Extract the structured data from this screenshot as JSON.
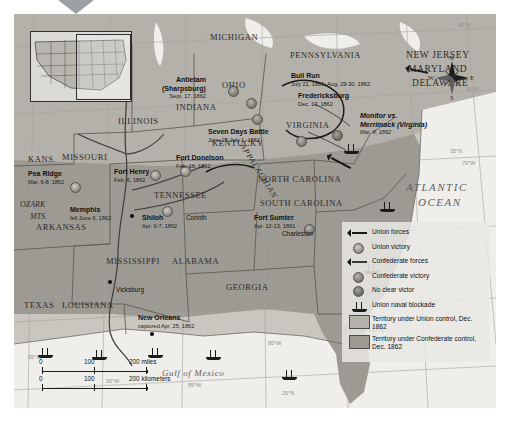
{
  "map": {
    "title": "Civil War in the East and West, 1861-1862",
    "ocean_label_line1": "ATLANTIC",
    "ocean_label_line2": "OCEAN",
    "gulf_label": "Gulf of Mexico",
    "ranges": [
      {
        "name": "APPALACHIAN"
      },
      {
        "name": "OZARK"
      },
      {
        "name": "MTS."
      }
    ],
    "states": [
      {
        "label": "MICHIGAN"
      },
      {
        "label": "PENNSYLVANIA"
      },
      {
        "label": "NEW JERSEY"
      },
      {
        "label": "MARYLAND"
      },
      {
        "label": "DELAWARE"
      },
      {
        "label": "OHIO"
      },
      {
        "label": "INDIANA"
      },
      {
        "label": "ILLINOIS"
      },
      {
        "label": "KENTUCKY"
      },
      {
        "label": "VIRGINIA"
      },
      {
        "label": "KANS."
      },
      {
        "label": "MISSOURI"
      },
      {
        "label": "TENNESSEE"
      },
      {
        "label": "NORTH CAROLINA"
      },
      {
        "label": "SOUTH CAROLINA"
      },
      {
        "label": "ARKANSAS"
      },
      {
        "label": "MISSISSIPPI"
      },
      {
        "label": "ALABAMA"
      },
      {
        "label": "GEORGIA"
      },
      {
        "label": "TEXAS"
      },
      {
        "label": "LOUISIANA"
      },
      {
        "label": "FLORIDA"
      }
    ],
    "cities": [
      {
        "label": "Charleston"
      },
      {
        "label": "Vicksburg"
      },
      {
        "label": "Corinth"
      }
    ],
    "battles": [
      {
        "name": "Antietam",
        "name2": "(Sharpsburg)",
        "date": "Sept. 17, 1862"
      },
      {
        "name": "Bull Run",
        "date": "July 21, 1861; Aug. 29-30, 1862"
      },
      {
        "name": "Fredericksburg",
        "date": "Dec. 13, 1862"
      },
      {
        "name": "Monitor vs.",
        "name2": "Merrimack (Virginia)",
        "date": "Mar. 9, 1862"
      },
      {
        "name": "Seven Days Battle",
        "date": "June 25-July 1, 1862"
      },
      {
        "name": "Pea Ridge",
        "date": "Mar. 6-8, 1862"
      },
      {
        "name": "Fort Henry",
        "date": "Feb. 6, 1862"
      },
      {
        "name": "Fort Donelson",
        "date": "Feb. 16, 1862"
      },
      {
        "name": "Memphis",
        "date": "fell June 6, 1862"
      },
      {
        "name": "Shiloh",
        "date": "Apr. 6-7, 1862"
      },
      {
        "name": "Fort Sumter",
        "date": "Apr. 12-13, 1861"
      },
      {
        "name": "New Orleans",
        "date": "captured Apr. 25, 1862"
      }
    ],
    "graticule": [
      {
        "label": "45°N"
      },
      {
        "label": "40°N"
      },
      {
        "label": "35°N"
      },
      {
        "label": "30°N"
      },
      {
        "label": "25°N"
      },
      {
        "label": "90°W"
      },
      {
        "label": "85°W"
      },
      {
        "label": "80°W"
      },
      {
        "label": "75°W"
      },
      {
        "label": "70°W"
      },
      {
        "label": "95°W"
      }
    ],
    "compass": {
      "n": "N",
      "e": "E",
      "s": "S",
      "w": "W"
    },
    "scale": {
      "miles": {
        "zero": "0",
        "mid": "100",
        "end": "200 miles"
      },
      "kilometers": {
        "zero": "0",
        "mid": "100",
        "end": "200 kilometers"
      }
    }
  },
  "legend": {
    "items": [
      {
        "symbol": "union-forces-arrow",
        "label": "Union forces"
      },
      {
        "symbol": "union-victory-marker",
        "label": "Union victory"
      },
      {
        "symbol": "confederate-forces-arrow",
        "label": "Confederate forces"
      },
      {
        "symbol": "confederate-victory-marker",
        "label": "Confederate victory"
      },
      {
        "symbol": "no-clear-victor-marker",
        "label": "No clear victor"
      },
      {
        "symbol": "union-naval-blockade-ship",
        "label": "Union naval blockade"
      }
    ],
    "swatches": [
      {
        "symbol": "union-territory-swatch",
        "label": "Territory under Union control, Dec. 1862"
      },
      {
        "symbol": "confederate-territory-swatch",
        "label": "Territory under Confederate control, Dec. 1862"
      }
    ]
  },
  "colors": {
    "union_fill": "#b4b1aa",
    "confederate_fill": "#9d9a93",
    "water": "#efeeea",
    "ink": "#161616"
  }
}
